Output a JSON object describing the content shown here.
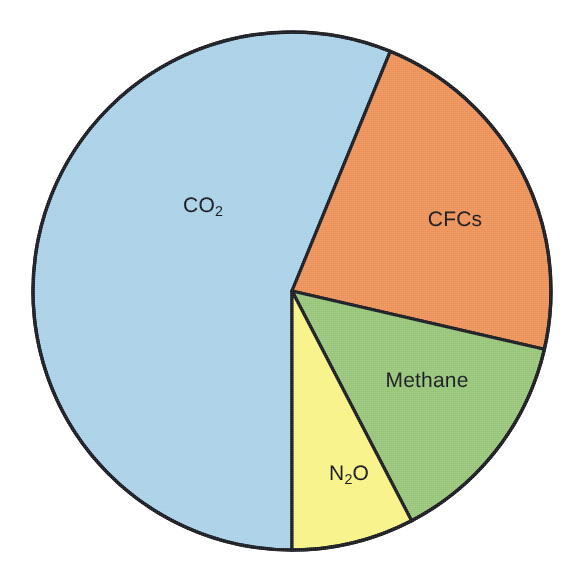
{
  "figure": {
    "background_color": "#ffffff",
    "outline_color": "#14161c",
    "label_color": "#101218"
  },
  "geometry": {
    "center_x": 292,
    "center_y": 291,
    "radius": 259
  },
  "chart_data": {
    "type": "pie",
    "title": "",
    "subtitle": "",
    "xlabel": "",
    "ylabel": "",
    "grid": false,
    "legend_position": "none",
    "label_placement": "inside-slice",
    "start_angle_deg": 180,
    "direction": "clockwise",
    "categories": [
      "CO2",
      "CFCs",
      "Methane",
      "N2O"
    ],
    "values": [
      56.2,
      22.4,
      13.8,
      7.6
    ],
    "units": "percent",
    "slices": [
      {
        "key": "co2",
        "label": "CO2",
        "label_html": "CO<sub>2</sub>",
        "value": 56.2,
        "angle_deg": 202.3,
        "start_deg": 180.0,
        "end_deg": 382.3,
        "color": "#a8d0e6",
        "label_x": 203,
        "label_y": 206
      },
      {
        "key": "cfcs",
        "label": "CFCs",
        "label_html": "CFCs",
        "value": 22.4,
        "angle_deg": 80.7,
        "start_deg": 22.3,
        "end_deg": 103.0,
        "color": "#ec8f54",
        "label_x": 455,
        "label_y": 220
      },
      {
        "key": "methane",
        "label": "Methane",
        "label_html": "Methane",
        "value": 13.8,
        "angle_deg": 49.5,
        "start_deg": 103.0,
        "end_deg": 152.5,
        "color": "#95c476",
        "label_x": 427,
        "label_y": 381
      },
      {
        "key": "n2o",
        "label": "N2O",
        "label_html": "N<sub>2</sub>O",
        "value": 7.6,
        "angle_deg": 27.5,
        "start_deg": 152.5,
        "end_deg": 180.0,
        "color": "#f7f284",
        "label_x": 349,
        "label_y": 474
      }
    ]
  }
}
